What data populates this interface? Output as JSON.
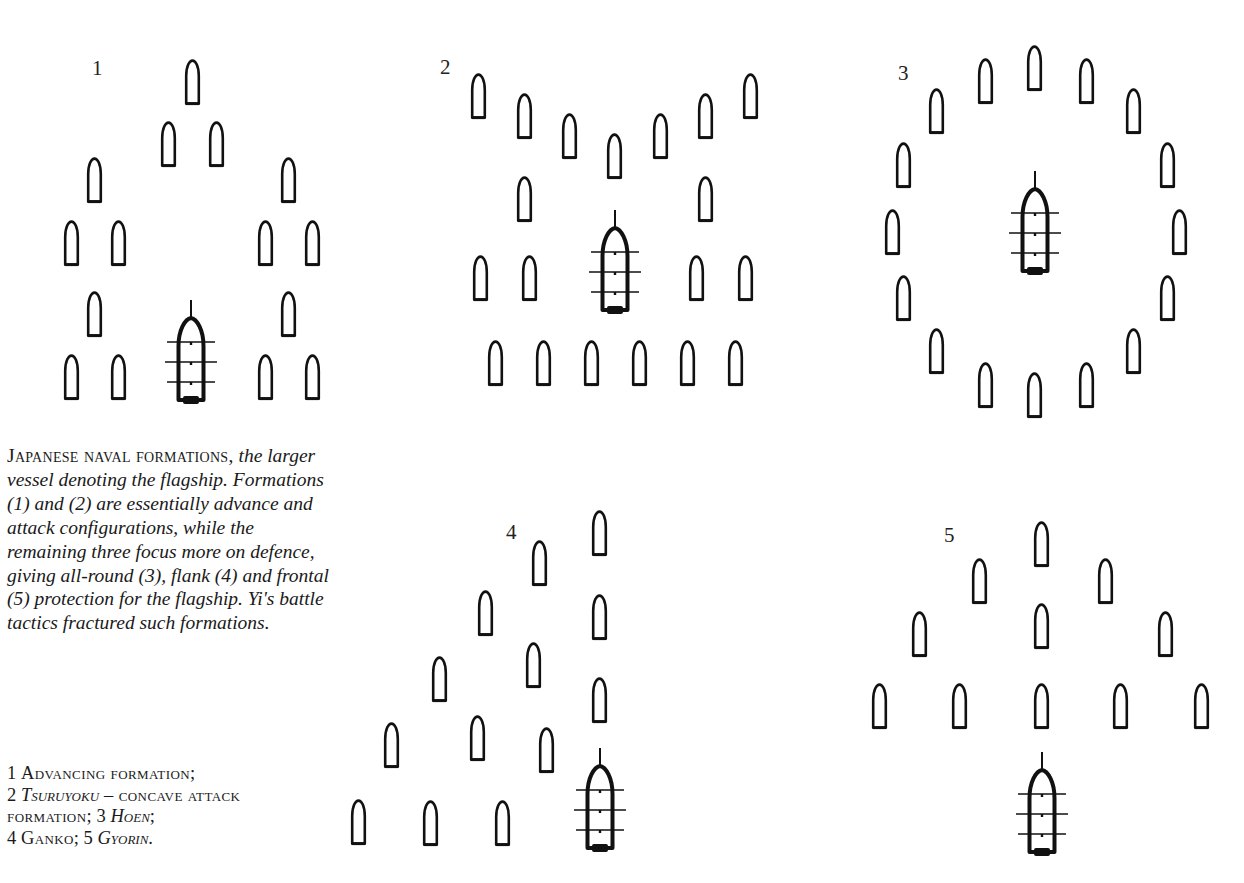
{
  "caption": {
    "lead": "Japanese naval formations,",
    "body": " the larger vessel denoting the flagship. Formations (1) and (2) are essentially advance and attack configurations, while the remaining three focus more on defence, giving all-round (3), flank (4) and frontal (5) protection for the flagship. Yi's battle tactics fractured such formations."
  },
  "key": {
    "items": [
      {
        "num": "1",
        "name": "Advancing formation",
        "italic": false,
        "sep": ";"
      },
      {
        "num": "2",
        "name": "Tsuruyoku",
        "italic": true,
        "sep": "",
        "desc": " – concave attack formation;"
      },
      {
        "num": "3",
        "name": "Hoen",
        "italic": true,
        "sep": ";"
      },
      {
        "num": "4",
        "name": "Ganko",
        "italic": false,
        "sep": ";"
      },
      {
        "num": "5",
        "name": "Gyorin",
        "italic": true,
        "sep": "."
      }
    ]
  },
  "legend": {
    "small_vessel": "escort-vessel",
    "large_vessel": "flagship"
  },
  "colors": {
    "ink": "#111111",
    "background": "#ffffff"
  },
  "boat_size": {
    "w": 17,
    "h": 47
  },
  "formations": [
    {
      "id": "1",
      "label": "1",
      "name": "Advancing formation",
      "label_pos": [
        92,
        58
      ],
      "flagship": [
        191,
        300
      ],
      "boats": [
        [
          184,
          59
        ],
        [
          160,
          121
        ],
        [
          208,
          121
        ],
        [
          86,
          157
        ],
        [
          63,
          220
        ],
        [
          110,
          220
        ],
        [
          86,
          291
        ],
        [
          63,
          354
        ],
        [
          110,
          354
        ],
        [
          280,
          157
        ],
        [
          257,
          220
        ],
        [
          304,
          220
        ],
        [
          280,
          291
        ],
        [
          257,
          354
        ],
        [
          304,
          354
        ]
      ]
    },
    {
      "id": "2",
      "label": "2",
      "name": "Tsuruyoku – concave attack formation",
      "label_pos": [
        440,
        57
      ],
      "flagship": [
        615,
        210
      ],
      "boats": [
        [
          470,
          73
        ],
        [
          516,
          93
        ],
        [
          561,
          113
        ],
        [
          606,
          133
        ],
        [
          652,
          113
        ],
        [
          697,
          93
        ],
        [
          742,
          73
        ],
        [
          516,
          176
        ],
        [
          697,
          176
        ],
        [
          472,
          255
        ],
        [
          521,
          255
        ],
        [
          688,
          255
        ],
        [
          737,
          255
        ],
        [
          487,
          340
        ],
        [
          535,
          340
        ],
        [
          583,
          340
        ],
        [
          631,
          340
        ],
        [
          679,
          340
        ],
        [
          727,
          340
        ]
      ]
    },
    {
      "id": "3",
      "label": "3",
      "name": "Hoen",
      "label_pos": [
        898,
        63
      ],
      "flagship": [
        1035,
        171
      ],
      "boats": [
        [
          1026,
          45
        ],
        [
          977,
          58
        ],
        [
          1078,
          58
        ],
        [
          928,
          88
        ],
        [
          1125,
          88
        ],
        [
          895,
          142
        ],
        [
          1159,
          142
        ],
        [
          884,
          209
        ],
        [
          1171,
          209
        ],
        [
          895,
          275
        ],
        [
          1159,
          275
        ],
        [
          928,
          328
        ],
        [
          1125,
          328
        ],
        [
          977,
          362
        ],
        [
          1078,
          362
        ],
        [
          1026,
          372
        ]
      ]
    },
    {
      "id": "4",
      "label": "4",
      "name": "Ganko",
      "label_pos": [
        506,
        522
      ],
      "flagship": [
        600,
        748
      ],
      "boats": [
        [
          591,
          510
        ],
        [
          531,
          540
        ],
        [
          591,
          594
        ],
        [
          477,
          590
        ],
        [
          525,
          642
        ],
        [
          591,
          677
        ],
        [
          431,
          656
        ],
        [
          383,
          722
        ],
        [
          469,
          715
        ],
        [
          538,
          727
        ],
        [
          350,
          799
        ],
        [
          422,
          800
        ],
        [
          494,
          800
        ]
      ]
    },
    {
      "id": "5",
      "label": "5",
      "name": "Gyorin",
      "label_pos": [
        944,
        525
      ],
      "flagship": [
        1042,
        752
      ],
      "boats": [
        [
          1033,
          521
        ],
        [
          971,
          558
        ],
        [
          1097,
          558
        ],
        [
          911,
          611
        ],
        [
          1033,
          603
        ],
        [
          1157,
          611
        ],
        [
          871,
          683
        ],
        [
          951,
          683
        ],
        [
          1033,
          683
        ],
        [
          1112,
          683
        ],
        [
          1193,
          683
        ]
      ]
    }
  ]
}
